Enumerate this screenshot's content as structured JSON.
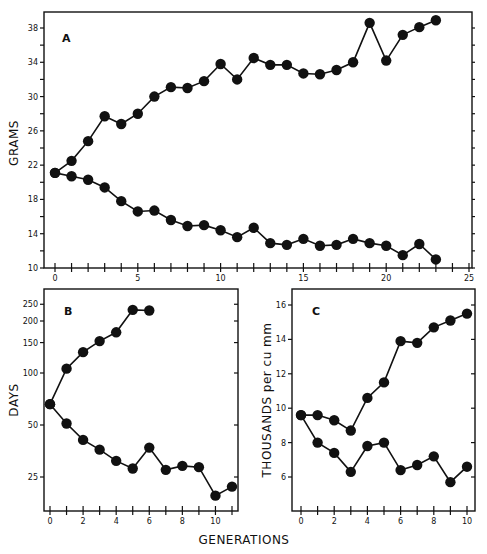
{
  "figure": {
    "shared_xlabel": "GENERATIONS"
  },
  "chart_data": [
    {
      "panel": "A",
      "type": "line",
      "title": "A",
      "xlabel": "",
      "ylabel": "GRAMS",
      "xlim": [
        0,
        25
      ],
      "ylim": [
        10,
        38
      ],
      "xticks": [
        0,
        5,
        10,
        15,
        20,
        25
      ],
      "yticks": [
        10,
        14,
        18,
        22,
        26,
        30,
        34,
        38
      ],
      "grid": false,
      "marker": "filled-circle",
      "x": [
        0,
        1,
        2,
        3,
        4,
        5,
        6,
        7,
        8,
        9,
        10,
        11,
        12,
        13,
        14,
        15,
        16,
        17,
        18,
        19,
        20,
        21,
        22,
        23
      ],
      "series": [
        {
          "name": "upper",
          "values": [
            21.1,
            22.5,
            24.8,
            27.7,
            26.8,
            28.0,
            30.0,
            31.1,
            31.0,
            31.8,
            33.8,
            32.0,
            34.5,
            33.7,
            33.7,
            32.7,
            32.6,
            33.1,
            34.0,
            38.6,
            34.2,
            37.2,
            38.1,
            38.9
          ]
        },
        {
          "name": "lower",
          "values": [
            21.1,
            20.7,
            20.3,
            19.4,
            17.8,
            16.6,
            16.7,
            15.6,
            14.9,
            15.0,
            14.4,
            13.6,
            14.7,
            12.9,
            12.7,
            13.4,
            12.6,
            12.7,
            13.4,
            12.9,
            12.6,
            11.5,
            12.8,
            11.0
          ]
        }
      ]
    },
    {
      "panel": "B",
      "type": "line",
      "title": "B",
      "xlabel": "GENERATIONS",
      "ylabel": "DAYS",
      "yscale": "log",
      "xlim": [
        0,
        11
      ],
      "ylim": [
        16,
        290
      ],
      "xticks": [
        0,
        2,
        4,
        6,
        8,
        10
      ],
      "yticks": [
        25,
        50,
        100,
        150,
        200,
        250
      ],
      "grid": false,
      "marker": "filled-circle",
      "series": [
        {
          "name": "upper",
          "x": [
            0,
            1,
            2,
            3,
            4,
            5,
            6
          ],
          "values": [
            66,
            106,
            132,
            153,
            172,
            232,
            230
          ]
        },
        {
          "name": "lower",
          "x": [
            0,
            1,
            2,
            3,
            4,
            5,
            6,
            7,
            8,
            9,
            10,
            11
          ],
          "values": [
            66,
            51,
            41,
            36,
            31,
            28,
            37,
            27.5,
            29,
            28.5,
            19.5,
            22
          ]
        }
      ]
    },
    {
      "panel": "C",
      "type": "line",
      "title": "C",
      "xlabel": "GENERATIONS",
      "ylabel": "THOUSANDS per cu mm",
      "xlim": [
        0,
        10
      ],
      "ylim": [
        4,
        17
      ],
      "xticks": [
        0,
        2,
        4,
        6,
        8,
        10
      ],
      "yticks": [
        6,
        8,
        10,
        12,
        14,
        16
      ],
      "grid": false,
      "marker": "filled-circle",
      "x": [
        0,
        1,
        2,
        3,
        4,
        5,
        6,
        7,
        8,
        9,
        10
      ],
      "series": [
        {
          "name": "upper",
          "values": [
            9.6,
            9.6,
            9.3,
            8.7,
            10.6,
            11.5,
            13.9,
            13.8,
            14.7,
            15.1,
            15.5
          ]
        },
        {
          "name": "lower",
          "values": [
            9.6,
            8.0,
            7.4,
            6.3,
            7.8,
            8.0,
            6.4,
            6.7,
            7.2,
            5.7,
            6.6
          ]
        }
      ]
    }
  ],
  "colors": {
    "ink": "#111111",
    "background": "#ffffff"
  }
}
